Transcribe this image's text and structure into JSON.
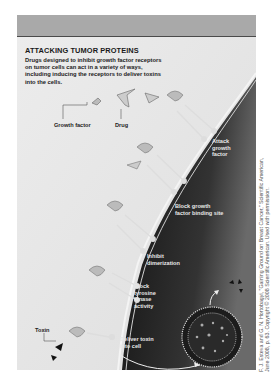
{
  "figure": {
    "title": "ATTACKING TUMOR PROTEINS",
    "description": "Drugs designed to inhibit growth factor receptors on tumor cells can act in a variety of ways, including inducing the receptors to deliver toxins into the cells.",
    "labels": {
      "growth_factor": "Growth factor",
      "drug": "Drug",
      "toxin": "Toxin"
    },
    "mechanisms": [
      {
        "label": "Attack\ngrowth\nfactor"
      },
      {
        "label": "Block growth\nfactor binding site"
      },
      {
        "label": "Inhibit\ndimerization"
      },
      {
        "label": "Block\ntyrosine\nkinase\nactivity"
      },
      {
        "label": "Deliver toxin\ninto cell"
      }
    ],
    "colors": {
      "header_band": "#a9a9a9",
      "extracellular": "#e6e6e6",
      "intracellular": "#222222",
      "membrane": "#f2f2f2"
    }
  },
  "credit": {
    "line1": "F. J. Esteva and G. N. Hortobagyi, \"Gaining Ground on Breast Cancer,\" Scientific American,",
    "line2": "June 2008, p. 63. Copyright © 2008 Scientific American. Used with permission."
  }
}
